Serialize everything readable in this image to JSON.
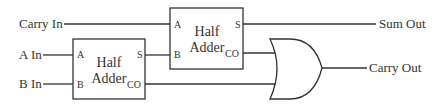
{
  "diagram": {
    "type": "full-adder-schematic",
    "inputs": [
      {
        "id": "carry_in",
        "label": "Carry In"
      },
      {
        "id": "a_in",
        "label": "A In"
      },
      {
        "id": "b_in",
        "label": "B In"
      }
    ],
    "outputs": [
      {
        "id": "sum_out",
        "label": "Sum Out"
      },
      {
        "id": "carry_out",
        "label": "Carry Out"
      }
    ],
    "blocks": [
      {
        "id": "half_adder_1",
        "title_line1": "Half",
        "title_line2": "Adder",
        "pins": {
          "a": "A",
          "b": "B",
          "s": "S",
          "co": "CO"
        }
      },
      {
        "id": "half_adder_2",
        "title_line1": "Half",
        "title_line2": "Adder",
        "pins": {
          "a": "A",
          "b": "B",
          "s": "S",
          "co": "CO"
        }
      }
    ],
    "gates": [
      {
        "id": "or_gate",
        "type": "OR"
      }
    ],
    "connections": [
      {
        "from": "Carry In",
        "to": "half_adder_2.A"
      },
      {
        "from": "A In",
        "to": "half_adder_1.A"
      },
      {
        "from": "B In",
        "to": "half_adder_1.B"
      },
      {
        "from": "half_adder_1.S",
        "to": "half_adder_2.B"
      },
      {
        "from": "half_adder_2.S",
        "to": "Sum Out"
      },
      {
        "from": "half_adder_2.CO",
        "to": "or_gate.in1"
      },
      {
        "from": "half_adder_1.CO",
        "to": "or_gate.in2"
      },
      {
        "from": "or_gate.out",
        "to": "Carry Out"
      }
    ],
    "colors": {
      "stroke": "#333333",
      "background": "#ffffff"
    }
  }
}
